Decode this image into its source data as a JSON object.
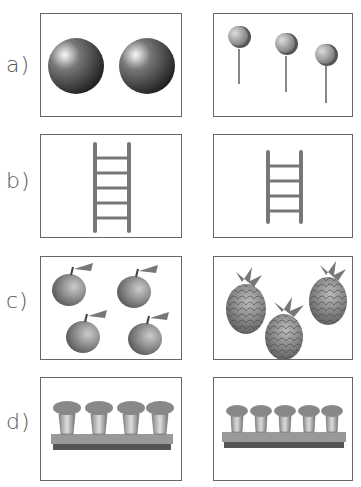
{
  "rows": [
    {
      "label": "a)",
      "left": {
        "item": "ball",
        "count": 2
      },
      "right": {
        "item": "lollipop",
        "count": 3
      }
    },
    {
      "label": "b)",
      "left": {
        "item": "ladder",
        "rungs": 5,
        "size": "tall"
      },
      "right": {
        "item": "ladder",
        "rungs": 4,
        "size": "short"
      }
    },
    {
      "label": "c)",
      "left": {
        "item": "apple",
        "count": 4
      },
      "right": {
        "item": "pineapple",
        "count": 3
      }
    },
    {
      "label": "d)",
      "left": {
        "item": "flower-pot",
        "count": 4
      },
      "right": {
        "item": "flower-pot",
        "count": 5
      }
    }
  ],
  "colors": {
    "border": "#666666",
    "label": "#555555"
  }
}
